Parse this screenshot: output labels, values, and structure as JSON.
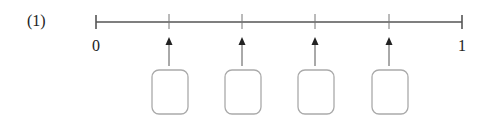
{
  "problem": {
    "number_label": "(1)",
    "number_line": {
      "start_label": "0",
      "end_label": "1",
      "tick_count": 4,
      "boxes": [
        "",
        "",
        "",
        ""
      ]
    }
  }
}
